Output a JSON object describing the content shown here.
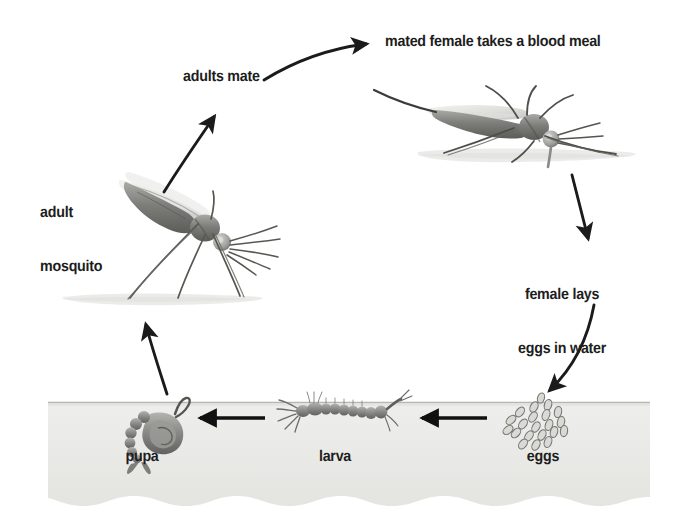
{
  "diagram": {
    "background_color": "#ffffff",
    "text_color": "#201d1c",
    "water_color": "#e8e8e6",
    "water_line_color": "#b9b9b6",
    "insect_color": "#6f6f6d",
    "arrow_color": "#1b1b1b"
  },
  "labels": {
    "blood_meal": "mated female takes a blood meal",
    "adults_mate": "adults mate",
    "adult_mosquito_line1": "adult",
    "adult_mosquito_line2": "mosquito",
    "female_lays_line1": "female lays",
    "female_lays_line2": "eggs in water",
    "pupa": "pupa",
    "larva": "larva",
    "eggs": "eggs"
  },
  "stages": [
    {
      "id": "eggs",
      "label": "eggs",
      "location": "water",
      "order": 1
    },
    {
      "id": "larva",
      "label": "larva",
      "location": "water",
      "order": 2
    },
    {
      "id": "pupa",
      "label": "pupa",
      "location": "water",
      "order": 3
    },
    {
      "id": "adult-mosquito",
      "label": "adult mosquito",
      "location": "air",
      "order": 4
    },
    {
      "id": "adults-mate",
      "label": "adults mate",
      "location": "air",
      "order": 5
    },
    {
      "id": "blood-meal",
      "label": "mated female takes a blood meal",
      "location": "air",
      "order": 6
    },
    {
      "id": "female-lays-eggs",
      "label": "female lays eggs in water",
      "location": "air",
      "order": 7
    }
  ],
  "arrows": [
    {
      "id": "pupa-to-adult",
      "from": "pupa",
      "to": "adult-mosquito",
      "direction": "up"
    },
    {
      "id": "adult-to-mate",
      "from": "adult-mosquito",
      "to": "adults-mate",
      "direction": "up-right"
    },
    {
      "id": "mate-to-blood-meal",
      "from": "adults-mate",
      "to": "blood-meal",
      "direction": "right"
    },
    {
      "id": "blood-meal-to-lays",
      "from": "blood-meal",
      "to": "female-lays-eggs",
      "direction": "down"
    },
    {
      "id": "lays-to-eggs",
      "from": "female-lays-eggs",
      "to": "eggs",
      "direction": "down-left"
    },
    {
      "id": "eggs-to-larva",
      "from": "eggs",
      "to": "larva",
      "direction": "left"
    },
    {
      "id": "larva-to-pupa",
      "from": "larva",
      "to": "pupa",
      "direction": "left"
    }
  ],
  "egg_cluster": {
    "count": 21
  },
  "icons": {
    "adult_mosquito": "mosquito-resting-icon",
    "blood_meal_mosquito": "mosquito-feeding-icon",
    "pupa": "pupa-icon",
    "larva": "larva-icon",
    "eggs": "egg-cluster-icon"
  }
}
